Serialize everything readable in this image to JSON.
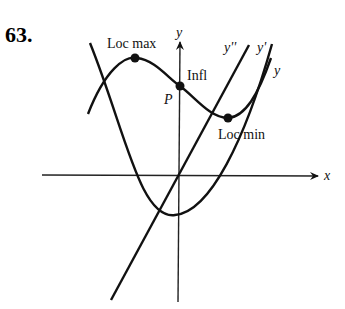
{
  "problem_number": "63.",
  "axes": {
    "x_label": "x",
    "y_label": "y"
  },
  "curve_labels": {
    "y2": "y''",
    "y1": "y'",
    "y0": "y"
  },
  "annotations": {
    "loc_max": "Loc max",
    "infl": "Infl",
    "point_p": "P",
    "loc_min": "Loc min"
  },
  "colors": {
    "ink": "#111111",
    "background": "#ffffff"
  }
}
